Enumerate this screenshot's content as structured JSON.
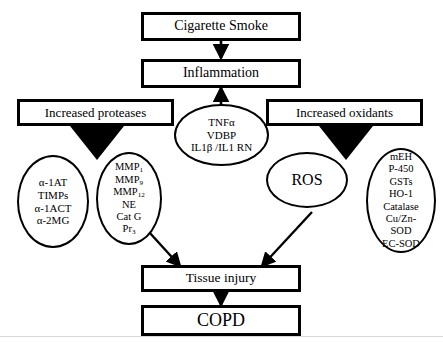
{
  "diagram": {
    "type": "flowchart",
    "colors": {
      "stroke": "#000000",
      "fill": "#ffffff",
      "triangle": "#000000"
    }
  },
  "boxes": {
    "cigarette_smoke": "Cigarette Smoke",
    "inflammation": "Inflammation",
    "increased_proteases": "Increased proteases",
    "increased_oxidants": "Increased oxidants",
    "tissue_injury": "Tissue injury",
    "copd": "COPD"
  },
  "ellipses": {
    "cytokines": {
      "name": "cytokine-mediators",
      "lines": [
        "TNFα",
        "VDBP",
        "IL1β /IL1 RN"
      ]
    },
    "antiproteases": {
      "name": "antiprotease-factors",
      "lines": [
        "α-1AT",
        "TIMPs",
        "α-1ACT",
        "α-2MG"
      ]
    },
    "proteases": {
      "name": "protease-factors",
      "lines": [
        "MMP1",
        "MMP9",
        "MMP12",
        "NE",
        "Cat G",
        "Pr3"
      ],
      "lines_html": [
        "MMP<sub>1</sub>",
        "MMP<sub>9</sub>",
        "MMP<sub>12</sub>",
        "NE",
        "Cat G",
        "Pr<sub>3</sub>"
      ]
    },
    "ros": {
      "name": "reactive-oxygen-species",
      "lines": [
        "ROS"
      ]
    },
    "antioxidants": {
      "name": "antioxidant-factors",
      "lines": [
        "mEH",
        "P-450",
        "GSTs",
        "HO-1",
        "Catalase",
        "Cu/Zn-",
        "SOD",
        "EC-SOD"
      ]
    }
  },
  "connections": [
    {
      "from": "cigarette_smoke",
      "to": "inflammation",
      "style": "straight-down-arrow"
    },
    {
      "from": "cytokines",
      "to": "inflammation",
      "style": "straight-up-arrow"
    },
    {
      "from": "increased_proteases",
      "to": "proteases",
      "style": "filled-triangle"
    },
    {
      "from": "increased_oxidants",
      "to": "ros",
      "style": "filled-triangle"
    },
    {
      "from": "proteases",
      "to": "tissue_injury",
      "style": "diagonal-arrow"
    },
    {
      "from": "ros",
      "to": "tissue_injury",
      "style": "diagonal-arrow"
    },
    {
      "from": "tissue_injury",
      "to": "copd",
      "style": "straight-down-arrow"
    }
  ]
}
